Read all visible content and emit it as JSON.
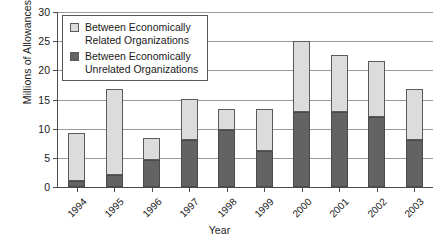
{
  "chart_data": {
    "type": "bar",
    "subtype": "stacked",
    "title": "",
    "xlabel": "Year",
    "ylabel": "Millions of Allowances",
    "categories": [
      "1994",
      "1995",
      "1996",
      "1997",
      "1998",
      "1999",
      "2000",
      "2001",
      "2002",
      "2003"
    ],
    "ylim": [
      0,
      30
    ],
    "yticks": [
      0,
      5,
      10,
      15,
      20,
      25,
      30
    ],
    "ytick_labels": [
      "0",
      "5",
      "10",
      "15",
      "20",
      "25",
      "30"
    ],
    "grid": true,
    "grid_axis": "y",
    "legend_position": "upper left",
    "series": [
      {
        "name": "Between Economically\nUnrelated Organizations",
        "legend_label_line1": "Between Economically",
        "legend_label_line2": "Unrelated Organizations",
        "color": "#636363",
        "values": [
          1.0,
          2.0,
          4.6,
          8.0,
          9.8,
          6.1,
          12.9,
          12.9,
          12.0,
          8.1
        ]
      },
      {
        "name": "Between Economically\nRelated Organizations",
        "legend_label_line1": "Between Economically",
        "legend_label_line2": "Related Organizations",
        "color": "#dcdcdc",
        "values": [
          8.3,
          14.8,
          3.8,
          7.1,
          3.6,
          7.3,
          12.1,
          9.8,
          9.6,
          8.7
        ]
      }
    ],
    "totals": [
      9.3,
      16.8,
      8.4,
      15.1,
      13.4,
      13.4,
      25.0,
      22.7,
      21.6,
      16.8
    ]
  },
  "legend": {
    "items": [
      {
        "swatch": "light-gray-square",
        "line1": "Between Economically",
        "line2": "Related Organizations",
        "color": "#dcdcdc"
      },
      {
        "swatch": "dark-gray-square",
        "line1": "Between Economically",
        "line2": "Unrelated Organizations",
        "color": "#636363"
      }
    ]
  },
  "axes": {
    "y_title": "Millions of Allowances",
    "x_title": "Year"
  }
}
